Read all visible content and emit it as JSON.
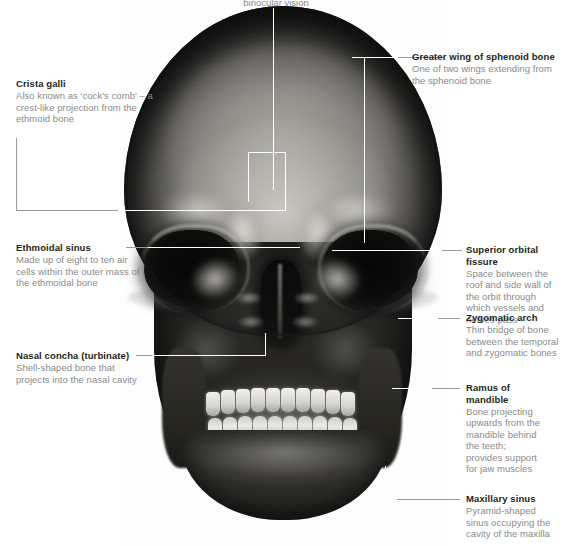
{
  "figure": {
    "top_caption": "binocular vision"
  },
  "annotations": [
    {
      "id": "crista-galli",
      "title": "Crista galli",
      "description": "Also known as 'cock's comb' – a crest-like projection from the ethmoid bone",
      "side": "left"
    },
    {
      "id": "ethmoidal-sinus",
      "title": "Ethmoidal sinus",
      "description": "Made up of eight to ten air cells within the outer mass of the ethmoidal bone",
      "side": "left"
    },
    {
      "id": "nasal-concha",
      "title": "Nasal concha (turbinate)",
      "description": "Shell-shaped bone that projects into the nasal cavity",
      "side": "left"
    },
    {
      "id": "greater-wing-sphenoid",
      "title": "Greater wing of sphenoid bone",
      "description": "One of two wings extending from the sphenoid bone",
      "side": "right"
    },
    {
      "id": "superior-orbital-fissure",
      "title": "Superior orbital fissure",
      "description": "Space between the roof and side wall of the orbit through which vessels and nerves pass",
      "side": "right"
    },
    {
      "id": "zygomatic-arch",
      "title": "Zygomatic arch",
      "description": "Thin bridge of bone between the temporal and zygomatic bones",
      "side": "right"
    },
    {
      "id": "ramus-of-mandible",
      "title": "Ramus of mandible",
      "description": "Bone projecting upwards from the mandible behind the teeth; provides support for jaw muscles",
      "side": "right"
    },
    {
      "id": "maxillary-sinus",
      "title": "Maxillary sinus",
      "description": "Pyramid-shaped sinus occupying the cavity of the maxilla",
      "side": "right"
    }
  ],
  "colors": {
    "title_text": "#231f20",
    "description_text": "#8a8a8a",
    "leader_line": "#ffffff",
    "leader_line_outside": "#9b9b9b",
    "background": "#ffffff"
  }
}
